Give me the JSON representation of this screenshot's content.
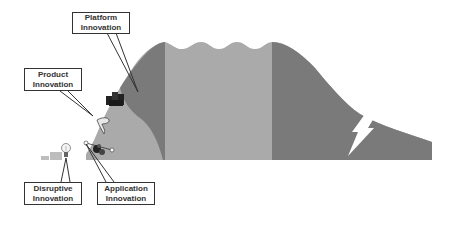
{
  "diagram": {
    "type": "innovation-lifecycle-curve",
    "colors": {
      "background": "#ffffff",
      "dark_section": "#7a7a7a",
      "light_section": "#aaaaaa",
      "steps": "#bdbdbd",
      "box_border": "#333333",
      "text": "#333333",
      "lightning": "#ffffff"
    },
    "labels": [
      {
        "id": "platform",
        "line1": "Platform",
        "line2": "Innovation"
      },
      {
        "id": "product",
        "line1": "Product",
        "line2": "Innovation"
      },
      {
        "id": "disruptive",
        "line1": "Disruptive",
        "line2": "Innovation"
      },
      {
        "id": "application",
        "line1": "Application",
        "line2": "Innovation"
      }
    ],
    "icons": [
      {
        "name": "lightbulb-icon",
        "near": "disruptive"
      },
      {
        "name": "gears-icon",
        "near": "application"
      },
      {
        "name": "product-figure-icon",
        "near": "product"
      },
      {
        "name": "factory-icon",
        "near": "platform"
      },
      {
        "name": "lightning-bolt-icon",
        "near": "decline"
      }
    ]
  }
}
